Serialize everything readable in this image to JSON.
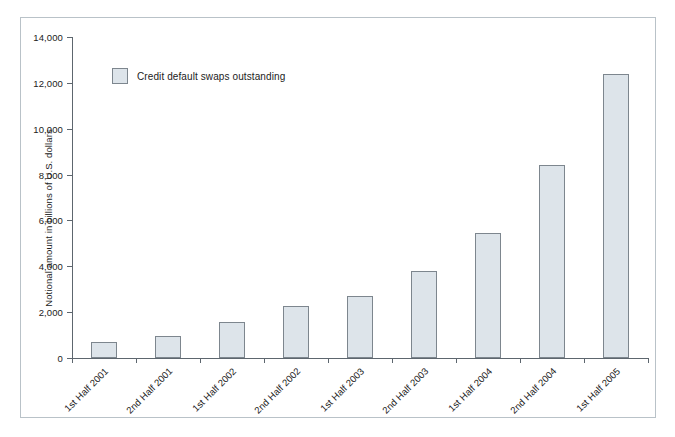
{
  "chart_data": {
    "type": "bar",
    "title": "",
    "subtitle": "",
    "xlabel": "",
    "ylabel": "Notional amount in billions of U.S. dollars",
    "ylim": [
      0,
      14000
    ],
    "yticks": [
      0,
      2000,
      4000,
      6000,
      8000,
      10000,
      12000,
      14000
    ],
    "ytick_labels": [
      "0",
      "2,000",
      "4,000",
      "6,000",
      "8,000",
      "10,000",
      "12,000",
      "14,000"
    ],
    "grid": false,
    "legend_position": "top-left",
    "legend": [
      "Credit default swaps outstanding"
    ],
    "categories": [
      "1st Half 2001",
      "2nd Half 2001",
      "1st Half 2002",
      "2nd Half 2002",
      "1st Half 2003",
      "2nd Half 2003",
      "1st Half 2004",
      "2nd Half 2004",
      "1st Half 2005"
    ],
    "series": [
      {
        "name": "Credit default swaps outstanding",
        "color": "#dde4ea",
        "edge_color": "#7d868e",
        "values": [
          700,
          940,
          1560,
          2250,
          2700,
          3800,
          5450,
          8400,
          12400
        ]
      }
    ]
  },
  "legend": {
    "swatch_name": "legend-swatch",
    "label": "Credit default swaps outstanding"
  },
  "axes": {
    "y_title": "Notional amount in billions of U.S. dollars"
  },
  "colors": {
    "bar_fill": "#dde4ea",
    "bar_edge": "#7d868e",
    "axis": "#5d666e",
    "frame": "#b9c2c8",
    "text": "#1b1b1b",
    "background": "#ffffff"
  }
}
